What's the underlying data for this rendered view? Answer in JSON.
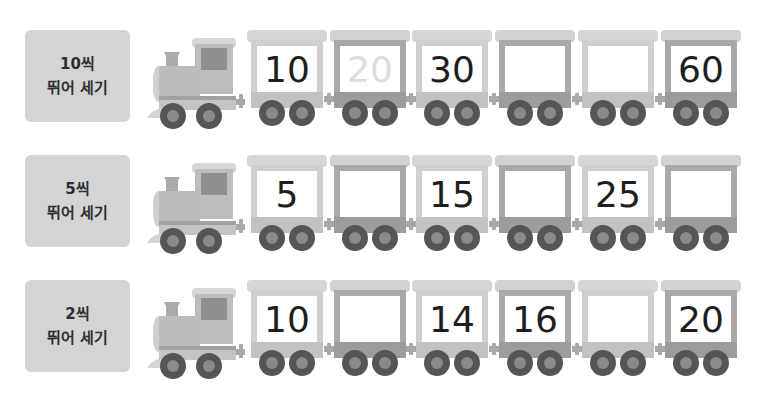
{
  "rows": [
    {
      "label_line1": "10씩",
      "label_line2": "뛰어 세기",
      "cars": [
        {
          "value": "10",
          "shade": "light",
          "faded": false
        },
        {
          "value": "20",
          "shade": "dark",
          "faded": true
        },
        {
          "value": "30",
          "shade": "light",
          "faded": false
        },
        {
          "value": "",
          "shade": "dark",
          "faded": false
        },
        {
          "value": "",
          "shade": "light",
          "faded": false
        },
        {
          "value": "60",
          "shade": "dark",
          "faded": false
        }
      ]
    },
    {
      "label_line1": "5씩",
      "label_line2": "뛰어 세기",
      "cars": [
        {
          "value": "5",
          "shade": "light",
          "faded": false
        },
        {
          "value": "",
          "shade": "dark",
          "faded": false
        },
        {
          "value": "15",
          "shade": "light",
          "faded": false
        },
        {
          "value": "",
          "shade": "dark",
          "faded": false
        },
        {
          "value": "25",
          "shade": "light",
          "faded": false
        },
        {
          "value": "",
          "shade": "dark",
          "faded": false
        }
      ]
    },
    {
      "label_line1": "2씩",
      "label_line2": "뛰어 세기",
      "cars": [
        {
          "value": "10",
          "shade": "light",
          "faded": false
        },
        {
          "value": "",
          "shade": "dark",
          "faded": false
        },
        {
          "value": "14",
          "shade": "light",
          "faded": false
        },
        {
          "value": "16",
          "shade": "dark",
          "faded": false
        },
        {
          "value": "",
          "shade": "light",
          "faded": false
        },
        {
          "value": "20",
          "shade": "dark",
          "faded": false
        }
      ]
    }
  ],
  "icons": {
    "engine": "locomotive-icon",
    "wheel": "wheel-icon"
  }
}
